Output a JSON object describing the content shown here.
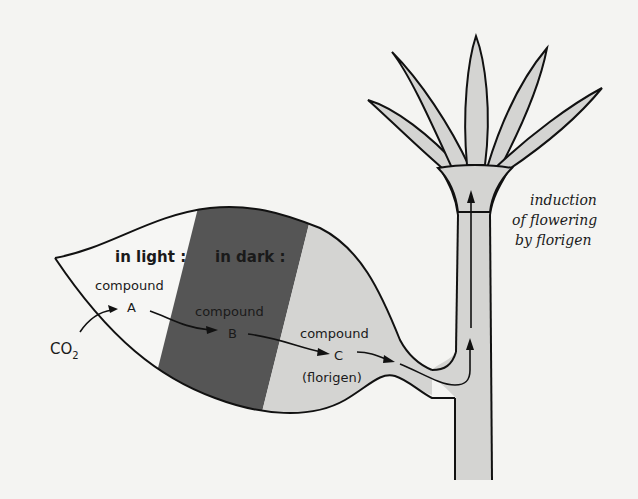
{
  "diagram": {
    "colors": {
      "background": "#f4f4f2",
      "outline": "#111111",
      "dark_band": "#555555",
      "light_fill": "#d4d4d2",
      "leaf_light_zone": "#f6f6f4"
    },
    "leaf": {
      "light_zone_label": "in light :",
      "dark_zone_label": "in dark :"
    },
    "compounds": {
      "a": {
        "line1": "compound",
        "line2": "A"
      },
      "b": {
        "line1": "compound",
        "line2": "B"
      },
      "c": {
        "line1": "compound",
        "line2": "C",
        "line3": "(florigen)"
      }
    },
    "input": {
      "base": "CO",
      "subscript": "2"
    },
    "caption": {
      "line1": "induction",
      "line2": "of flowering",
      "line3": "by florigen"
    }
  }
}
